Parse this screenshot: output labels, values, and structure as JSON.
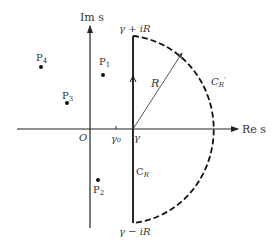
{
  "diagram": {
    "axes": {
      "real_label": "Re s",
      "imag_label": "Im s",
      "origin_label": "O"
    },
    "ticks": {
      "gamma0_label": "γ₀",
      "gamma_label": "γ"
    },
    "contour": {
      "top_label": "γ + iR",
      "bottom_label": "γ − iR",
      "line_label": "C",
      "line_label_sub": "R",
      "arc_label": "C",
      "arc_label_sub": "R",
      "arc_label_prime": "′",
      "radius_label": "R"
    },
    "poles": [
      {
        "label": "P",
        "sub": "1"
      },
      {
        "label": "P",
        "sub": "2"
      },
      {
        "label": "P",
        "sub": "3"
      },
      {
        "label": "P",
        "sub": "4"
      }
    ],
    "colors": {
      "stroke": "#222222",
      "text": "#333333"
    }
  }
}
